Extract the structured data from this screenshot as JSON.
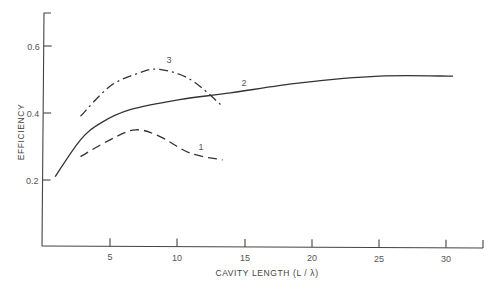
{
  "chart_data": {
    "type": "line",
    "title": "",
    "xlabel": "CAVITY LENGTH (L / λ)",
    "ylabel": "EFFICIENCY",
    "xlim": [
      0,
      32.5
    ],
    "ylim": [
      0.0,
      0.7
    ],
    "x_ticks": [
      5,
      10,
      15,
      20,
      25,
      30
    ],
    "x_tick_labels": [
      "5",
      "10",
      "15",
      "20",
      "25",
      "30"
    ],
    "y_ticks": [
      0.2,
      0.4,
      0.6
    ],
    "y_tick_labels": [
      "0.2",
      "0.4",
      "0.6"
    ],
    "grid": false,
    "legend": "inline curve labels",
    "series": [
      {
        "name": "1",
        "style": "dashed",
        "x": [
          2.8,
          5.0,
          6.9,
          8.7,
          11.0,
          13.4
        ],
        "values": [
          0.27,
          0.32,
          0.35,
          0.33,
          0.28,
          0.26
        ]
      },
      {
        "name": "2",
        "style": "solid",
        "x": [
          0.9,
          2.8,
          4.3,
          6.5,
          10.2,
          14.0,
          19.2,
          25.1,
          30.6
        ],
        "values": [
          0.21,
          0.32,
          0.37,
          0.41,
          0.44,
          0.46,
          0.49,
          0.51,
          0.51
        ]
      },
      {
        "name": "3",
        "style": "dash-dot",
        "x": [
          2.8,
          5.0,
          7.2,
          8.7,
          11.0,
          13.4
        ],
        "values": [
          0.39,
          0.48,
          0.52,
          0.53,
          0.5,
          0.42
        ]
      }
    ],
    "annotations": [
      {
        "text": "1",
        "x": 11.8,
        "y": 0.29
      },
      {
        "text": "2",
        "x": 15.0,
        "y": 0.48
      },
      {
        "text": "3",
        "x": 9.4,
        "y": 0.55
      }
    ]
  }
}
